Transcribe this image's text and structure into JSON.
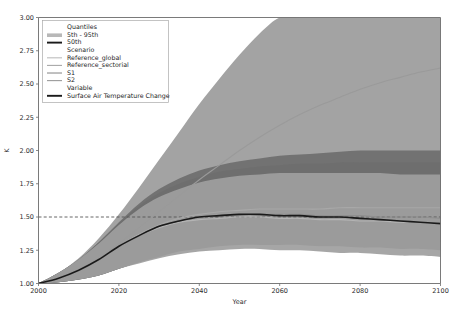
{
  "chart_data": {
    "type": "area",
    "title": "",
    "xlabel": "Year",
    "ylabel": "K",
    "xlim": [
      2000,
      2100
    ],
    "ylim": [
      1.0,
      3.0
    ],
    "xticks": [
      2000,
      2020,
      2040,
      2060,
      2080,
      2100
    ],
    "xtick_labels": [
      "2000",
      "2020",
      "2040",
      "2060",
      "2080",
      "2100"
    ],
    "yticks": [
      1.0,
      1.25,
      1.5,
      1.75,
      2.0,
      2.25,
      2.5,
      2.75,
      3.0
    ],
    "ytick_labels": [
      "1.00",
      "1.25",
      "1.50",
      "1.75",
      "2.00",
      "2.25",
      "2.50",
      "2.75",
      "3.00"
    ],
    "grid": false,
    "legend_position": "upper-left",
    "reference_line": {
      "label": "1.5 K threshold",
      "value": 1.5,
      "orientation": "horizontal",
      "style": "dashed",
      "color": "#555555"
    },
    "x": [
      2000,
      2005,
      2010,
      2015,
      2020,
      2025,
      2030,
      2035,
      2040,
      2045,
      2050,
      2055,
      2060,
      2065,
      2070,
      2075,
      2080,
      2085,
      2090,
      2095,
      2100
    ],
    "series": [
      {
        "name": "Reference_global",
        "kind": "line",
        "color": "#9a9a9a",
        "values": [
          1.0,
          1.04,
          1.1,
          1.19,
          1.3,
          1.42,
          1.54,
          1.66,
          1.78,
          1.89,
          2.0,
          2.1,
          2.19,
          2.27,
          2.34,
          2.4,
          2.46,
          2.51,
          2.55,
          2.59,
          2.62
        ],
        "band_5th": [
          1.0,
          1.01,
          1.03,
          1.07,
          1.12,
          1.19,
          1.27,
          1.35,
          1.43,
          1.5,
          1.57,
          1.63,
          1.69,
          1.73,
          1.77,
          1.8,
          1.83,
          1.85,
          1.87,
          1.88,
          1.89
        ],
        "band_95th": [
          1.0,
          1.08,
          1.19,
          1.34,
          1.52,
          1.72,
          1.93,
          2.14,
          2.35,
          2.54,
          2.72,
          2.88,
          3.0,
          3.0,
          3.0,
          3.0,
          3.0,
          3.0,
          3.0,
          3.0,
          3.0
        ]
      },
      {
        "name": "Reference_sectorial",
        "kind": "line",
        "color": "#a8a8a8",
        "values": [
          1.0,
          1.04,
          1.1,
          1.18,
          1.28,
          1.37,
          1.44,
          1.49,
          1.52,
          1.54,
          1.55,
          1.56,
          1.56,
          1.56,
          1.56,
          1.57,
          1.57,
          1.57,
          1.57,
          1.57,
          1.57
        ],
        "band_5th": [
          1.0,
          1.01,
          1.03,
          1.06,
          1.11,
          1.16,
          1.21,
          1.25,
          1.28,
          1.3,
          1.31,
          1.32,
          1.32,
          1.32,
          1.32,
          1.32,
          1.32,
          1.32,
          1.32,
          1.31,
          1.31
        ],
        "band_95th": [
          1.0,
          1.08,
          1.18,
          1.31,
          1.46,
          1.6,
          1.71,
          1.79,
          1.85,
          1.89,
          1.92,
          1.94,
          1.96,
          1.97,
          1.98,
          1.99,
          2.0,
          2.0,
          2.0,
          2.0,
          2.0
        ]
      },
      {
        "name": "S1",
        "kind": "line",
        "color": "#8e8e8e",
        "values": [
          1.0,
          1.04,
          1.1,
          1.18,
          1.28,
          1.36,
          1.43,
          1.47,
          1.5,
          1.51,
          1.52,
          1.52,
          1.52,
          1.52,
          1.51,
          1.51,
          1.51,
          1.5,
          1.5,
          1.5,
          1.49
        ],
        "band_5th": [
          1.0,
          1.01,
          1.03,
          1.06,
          1.11,
          1.16,
          1.2,
          1.24,
          1.26,
          1.28,
          1.29,
          1.29,
          1.29,
          1.29,
          1.28,
          1.28,
          1.27,
          1.27,
          1.26,
          1.26,
          1.25
        ],
        "band_95th": [
          1.0,
          1.08,
          1.18,
          1.31,
          1.45,
          1.58,
          1.68,
          1.75,
          1.8,
          1.84,
          1.86,
          1.88,
          1.89,
          1.9,
          1.9,
          1.91,
          1.91,
          1.91,
          1.91,
          1.91,
          1.91
        ]
      },
      {
        "name": "S2",
        "kind": "line",
        "color": "#b4b4b4",
        "values": [
          1.0,
          1.04,
          1.1,
          1.18,
          1.28,
          1.36,
          1.42,
          1.46,
          1.48,
          1.49,
          1.5,
          1.5,
          1.49,
          1.49,
          1.48,
          1.48,
          1.47,
          1.47,
          1.46,
          1.46,
          1.45
        ],
        "band_5th": [
          1.0,
          1.01,
          1.03,
          1.06,
          1.11,
          1.15,
          1.19,
          1.22,
          1.24,
          1.25,
          1.26,
          1.26,
          1.25,
          1.25,
          1.24,
          1.23,
          1.23,
          1.22,
          1.21,
          1.21,
          1.2
        ],
        "band_95th": [
          1.0,
          1.08,
          1.18,
          1.3,
          1.44,
          1.56,
          1.65,
          1.71,
          1.76,
          1.79,
          1.81,
          1.82,
          1.83,
          1.83,
          1.83,
          1.83,
          1.83,
          1.83,
          1.82,
          1.82,
          1.82
        ]
      },
      {
        "name": "Surface Air Temperature Change",
        "kind": "median-line",
        "color": "#1a1a1a",
        "values": [
          1.0,
          1.04,
          1.1,
          1.18,
          1.28,
          1.36,
          1.43,
          1.47,
          1.5,
          1.51,
          1.52,
          1.52,
          1.51,
          1.51,
          1.5,
          1.5,
          1.49,
          1.48,
          1.47,
          1.46,
          1.45
        ]
      }
    ]
  },
  "legend": {
    "groups": [
      {
        "title": "Quantiles",
        "items": [
          {
            "label": "5th - 95th",
            "marker": "band-swatch",
            "color": "#b8b8b8"
          },
          {
            "label": "50th",
            "marker": "thick-line",
            "color": "#1a1a1a"
          }
        ]
      },
      {
        "title": "Scenario",
        "items": [
          {
            "label": "Reference_global",
            "marker": "line",
            "color": "#bdbdbd"
          },
          {
            "label": "Reference_sectorial",
            "marker": "line",
            "color": "#a8a8a8"
          },
          {
            "label": "S1",
            "marker": "line",
            "color": "#8e8e8e"
          },
          {
            "label": "S2",
            "marker": "line",
            "color": "#9a9a9a"
          }
        ]
      },
      {
        "title": "Variable",
        "items": [
          {
            "label": "Surface Air Temperature Change",
            "marker": "thick-line",
            "color": "#1a1a1a"
          }
        ]
      }
    ]
  },
  "colors": {
    "band_outer": "#9e9e9e",
    "band_inner": "#6e6e6e",
    "band_light": "#c4c4c4",
    "median": "#1a1a1a",
    "axis": "#6b6b6b",
    "background": "#ffffff"
  }
}
